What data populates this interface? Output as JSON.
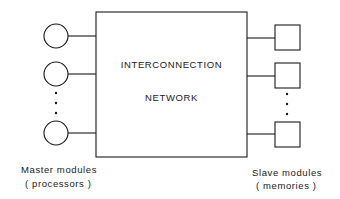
{
  "network": {
    "line1": "INTERCONNECTION",
    "line2": "NETWORK"
  },
  "masters": {
    "label": "Master modules",
    "sublabel": "( processors )",
    "shape": "circle",
    "count_visible": 3
  },
  "slaves": {
    "label": "Slave modules",
    "sublabel": "( memories )",
    "shape": "square",
    "count_visible": 3
  },
  "colors": {
    "stroke": "#1a1a1a",
    "background": "#ffffff"
  }
}
